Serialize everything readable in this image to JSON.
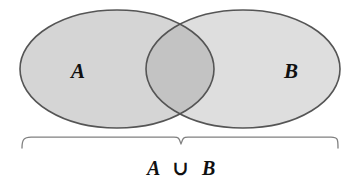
{
  "figure": {
    "name": "venn-diagram-union",
    "background_color": "#ffffff",
    "width": 360,
    "height": 187
  },
  "sets": {
    "left": {
      "label": "A",
      "fill_color": "#d5d5d5",
      "stroke_color": "#555555",
      "center_x": 117,
      "center_y": 69,
      "radius_x": 97,
      "radius_y": 59
    },
    "right": {
      "label": "B",
      "fill_color": "#dedede",
      "stroke_color": "#555555",
      "center_x": 243,
      "center_y": 69,
      "radius_x": 97,
      "radius_y": 59
    },
    "intersection": {
      "fill_color": "#c3c3c3",
      "shape": "lens"
    }
  },
  "brace": {
    "name": "underbrace",
    "stroke_color": "#777777",
    "start_x": 21,
    "end_x": 339,
    "y": 137,
    "notch_x": 181,
    "notch_depth": 7
  },
  "caption": {
    "left_operand": "A",
    "operator": "∪",
    "right_operand": "B",
    "full_text": "A ∪ B",
    "color": "#101010"
  }
}
